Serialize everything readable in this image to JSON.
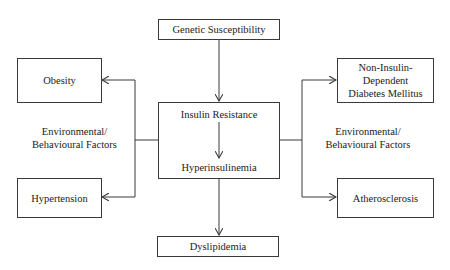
{
  "diagram": {
    "nodes": {
      "genetic": {
        "label": "Genetic Susceptibility"
      },
      "obesity": {
        "label": "Obesity"
      },
      "niddm": {
        "line1": "Non-Insulin-",
        "line2": "Dependent",
        "line3": "Diabetes Mellitus"
      },
      "insulin_resistance": {
        "label": "Insulin Resistance"
      },
      "hyperinsulinemia": {
        "label": "Hyperinsulinemia"
      },
      "hypertension": {
        "label": "Hypertension"
      },
      "atherosclerosis": {
        "label": "Atherosclerosis"
      },
      "dyslipidemia": {
        "label": "Dyslipidemia"
      }
    },
    "side_labels": {
      "left": {
        "line1": "Environmental/",
        "line2": "Behavioural Factors"
      },
      "right": {
        "line1": "Environmental/",
        "line2": "Behavioural Factors"
      }
    },
    "edges": [
      {
        "from": "genetic",
        "to": "insulin_resistance"
      },
      {
        "from": "insulin_resistance",
        "to": "hyperinsulinemia"
      },
      {
        "from": "hyperinsulinemia",
        "to": "dyslipidemia"
      },
      {
        "from": "central",
        "to": "obesity"
      },
      {
        "from": "central",
        "to": "hypertension"
      },
      {
        "from": "central",
        "to": "niddm"
      },
      {
        "from": "central",
        "to": "atherosclerosis"
      }
    ],
    "line_color": "#3a3a3a"
  }
}
